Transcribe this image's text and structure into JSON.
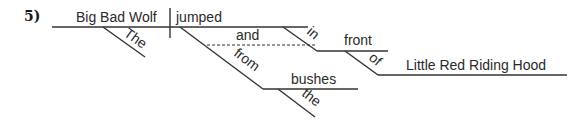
{
  "problem_number": "5)",
  "diagram": {
    "subject": "Big Bad Wolf",
    "subject_modifier": "The",
    "verb": "jumped",
    "conjunction": "and",
    "preposition_1": "in",
    "object_1": "front",
    "preposition_2": "of",
    "object_2": "Little Red Riding Hood",
    "preposition_3": "from",
    "object_3": "bushes",
    "object_3_modifier": "the"
  },
  "colors": {
    "line": "#333333",
    "text": "#2a2a2a"
  }
}
